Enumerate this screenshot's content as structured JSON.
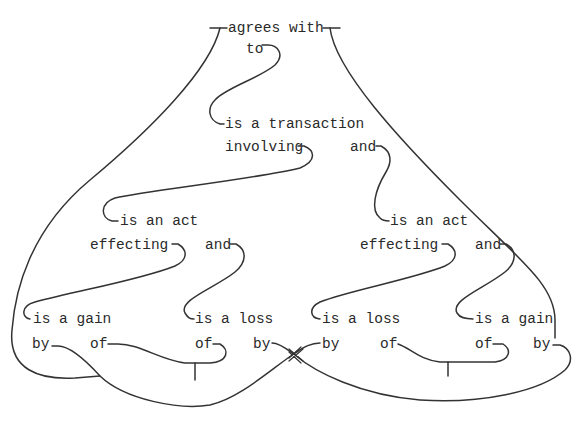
{
  "diagram": {
    "type": "conceptual-graph",
    "colors": {
      "line": "#333333",
      "text": "#2a2a2a",
      "background": "#ffffff"
    },
    "nodes": {
      "root": "agrees with",
      "to": "to",
      "transaction": "is a transaction",
      "involving": "involving",
      "and_top": "and",
      "act_left": "is an act",
      "effecting_left": "effecting",
      "and_left": "and",
      "act_right": "is an act",
      "effecting_right": "effecting",
      "and_right": "and",
      "gain_left": "is a gain",
      "loss_left": "is a loss",
      "loss_right": "is a loss",
      "gain_right": "is a gain",
      "by_gain_left": "by",
      "of_gain_left": "of",
      "of_loss_left": "of",
      "by_loss_left": "by",
      "by_loss_right": "by",
      "of_loss_right": "of",
      "of_gain_right": "of",
      "by_gain_right": "by"
    },
    "crossing_marker": "crossed-lines-icon"
  }
}
